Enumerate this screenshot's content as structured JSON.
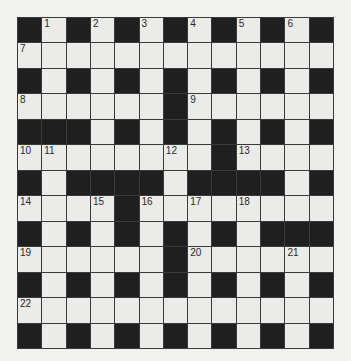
{
  "puzzle": {
    "rows": 13,
    "cols": 13,
    "layout": [
      "#.#.#.#.#.#.#",
      ".............",
      "#.#.#.#.#.#.#",
      "......#......",
      "###.#.#.#.#.#",
      "........#....",
      "#.####.####.#",
      "....#........",
      "#.#.#.#.#.###",
      "......#......",
      "#.#.#.#.#.#.#",
      ".............",
      "#.#.#.#.#.#.#"
    ],
    "numbers": [
      {
        "row": 0,
        "col": 1,
        "n": "1"
      },
      {
        "row": 0,
        "col": 3,
        "n": "2"
      },
      {
        "row": 0,
        "col": 5,
        "n": "3"
      },
      {
        "row": 0,
        "col": 7,
        "n": "4"
      },
      {
        "row": 0,
        "col": 9,
        "n": "5"
      },
      {
        "row": 0,
        "col": 11,
        "n": "6"
      },
      {
        "row": 1,
        "col": 0,
        "n": "7"
      },
      {
        "row": 3,
        "col": 0,
        "n": "8"
      },
      {
        "row": 3,
        "col": 7,
        "n": "9"
      },
      {
        "row": 5,
        "col": 0,
        "n": "10"
      },
      {
        "row": 5,
        "col": 1,
        "n": "11"
      },
      {
        "row": 5,
        "col": 6,
        "n": "12"
      },
      {
        "row": 5,
        "col": 9,
        "n": "13"
      },
      {
        "row": 7,
        "col": 0,
        "n": "14"
      },
      {
        "row": 7,
        "col": 3,
        "n": "15"
      },
      {
        "row": 7,
        "col": 5,
        "n": "16"
      },
      {
        "row": 7,
        "col": 7,
        "n": "17"
      },
      {
        "row": 7,
        "col": 9,
        "n": "18"
      },
      {
        "row": 9,
        "col": 0,
        "n": "19"
      },
      {
        "row": 9,
        "col": 7,
        "n": "20"
      },
      {
        "row": 9,
        "col": 11,
        "n": "21"
      },
      {
        "row": 11,
        "col": 0,
        "n": "22"
      }
    ],
    "colors": {
      "black_cell": "#1f1f1f",
      "white_cell": "#ebebe9",
      "grid_line": "#3a3a3a",
      "background": "#f1f1ef"
    }
  }
}
